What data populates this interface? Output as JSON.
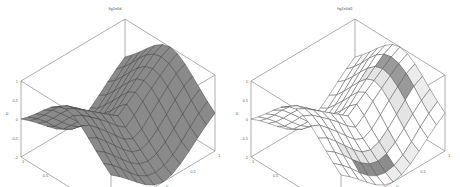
{
  "chart_data": [
    {
      "type": "surface3d",
      "title": "fig1n0d",
      "xlabel": "x",
      "ylabel": "y",
      "zlabel": "u",
      "xlim": [
        -1,
        1
      ],
      "ylim": [
        -1,
        1
      ],
      "zlim": [
        -1,
        1
      ],
      "xticks": [
        "-1",
        "-0.5",
        "0",
        "0.5",
        "1"
      ],
      "yticks": [
        "-1",
        "-0.5",
        "0",
        "0.5",
        "1"
      ],
      "zticks": [
        "-1",
        "-0.5",
        "0",
        "0.5",
        "1"
      ],
      "grid_n": 12,
      "face_color": "#8a8a8a",
      "edge_color": "#3a3a3a",
      "highlight": "none"
    },
    {
      "type": "surface3d",
      "title": "fig1n0d1",
      "xlabel": "x",
      "ylabel": "y",
      "zlabel": "u",
      "xlim": [
        -1,
        1
      ],
      "ylim": [
        -1,
        1
      ],
      "zlim": [
        -1,
        1
      ],
      "xticks": [
        "-1",
        "-0.5",
        "0",
        "0.5",
        "1"
      ],
      "yticks": [
        "-1",
        "-0.5",
        "0",
        "0.5",
        "1"
      ],
      "zticks": [
        "-1",
        "-0.5",
        "0",
        "0.5",
        "1"
      ],
      "grid_n": 12,
      "face_color": "#ffffff",
      "edge_color": "#4a4a4a",
      "highlight": "bands"
    }
  ],
  "panels": [
    {
      "title": "fig1n0d"
    },
    {
      "title": "fig1n0d1"
    }
  ]
}
